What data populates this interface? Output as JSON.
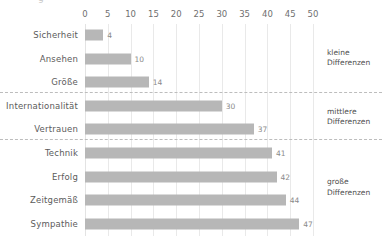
{
  "clipped_title": "g",
  "chart_data": {
    "type": "bar",
    "orientation": "horizontal",
    "title": "",
    "xlabel": "",
    "ylabel": "",
    "xlim": [
      0,
      50
    ],
    "xticks": [
      0,
      5,
      10,
      15,
      20,
      25,
      30,
      35,
      40,
      45,
      50
    ],
    "grid": "vertical",
    "legend": "none",
    "bar_color": "#b7b7b7",
    "categories": [
      "Sicherheit",
      "Ansehen",
      "Größe",
      "Internationalität",
      "Vertrauen",
      "Technik",
      "Erfolg",
      "Zeitgemäß",
      "Sympathie"
    ],
    "values": [
      4,
      10,
      14,
      30,
      37,
      41,
      42,
      44,
      47
    ],
    "groups": [
      {
        "label": "kleine\nDifferenzen",
        "line1": "kleine",
        "line2": "Differenzen",
        "categories": [
          "Sicherheit",
          "Ansehen",
          "Größe"
        ]
      },
      {
        "label": "mittlere\nDifferenzen",
        "line1": "mittlere",
        "line2": "Differenzen",
        "categories": [
          "Internationalität",
          "Vertrauen"
        ]
      },
      {
        "label": "große\nDifferenzen",
        "line1": "große",
        "line2": "Differenzen",
        "categories": [
          "Technik",
          "Erfolg",
          "Zeitgemäß",
          "Sympathie"
        ]
      }
    ]
  }
}
